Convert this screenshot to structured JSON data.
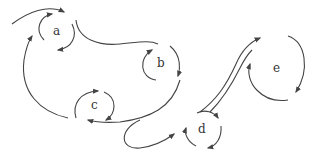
{
  "diagram": {
    "type": "vortex-flow-sketch",
    "nodes": [
      {
        "id": "a",
        "label": "a",
        "x": 57,
        "y": 31
      },
      {
        "id": "b",
        "label": "b",
        "x": 161,
        "y": 62
      },
      {
        "id": "c",
        "label": "c",
        "x": 95,
        "y": 105
      },
      {
        "id": "d",
        "label": "d",
        "x": 203,
        "y": 128
      },
      {
        "id": "e",
        "label": "e",
        "x": 276,
        "y": 69
      }
    ],
    "colors": {
      "stroke": "#444444",
      "label": "#333333",
      "background": "#ffffff"
    }
  }
}
